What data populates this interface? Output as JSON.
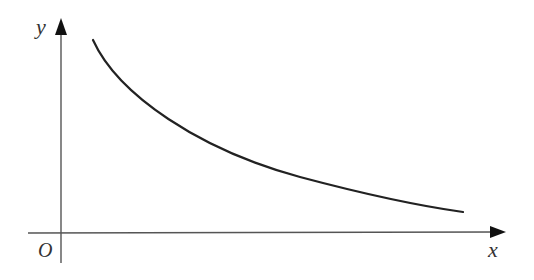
{
  "diagram": {
    "type": "function-graph",
    "axes": {
      "x_label": "x",
      "y_label": "y",
      "origin_label": "O",
      "axis_color": "#555555",
      "arrowhead_color": "#111111"
    },
    "curve": {
      "color": "#222222",
      "shape": "decreasing-convex",
      "points": [
        [
          93,
          40
        ],
        [
          120,
          75
        ],
        [
          180,
          118
        ],
        [
          250,
          155
        ],
        [
          330,
          184
        ],
        [
          400,
          201
        ],
        [
          463,
          212
        ]
      ]
    }
  }
}
